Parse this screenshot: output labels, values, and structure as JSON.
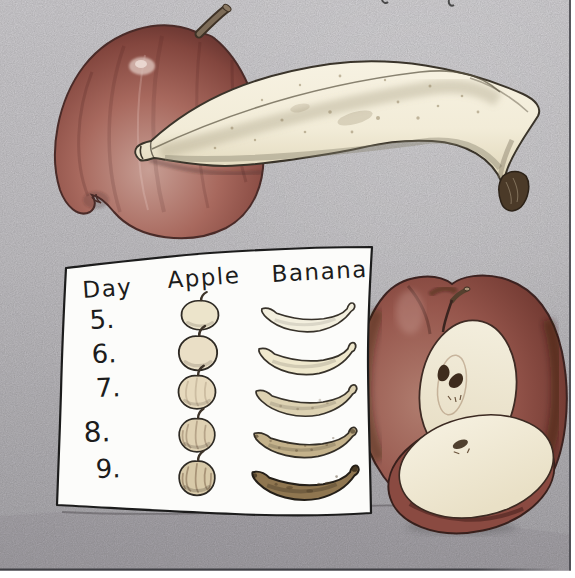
{
  "illustration": {
    "top_scene_alt": "Whole apple with a banana lying in front of it",
    "right_scene_alt": "Apple cut in half with a cut slice in front",
    "chart_alt": "Hand-drawn fruit ripening observation chart on white paper"
  },
  "chart_note": {
    "headers": [
      "Day",
      "Apple",
      "Banana"
    ],
    "rows": [
      {
        "day": "5.",
        "apple_color": "#ece4cb",
        "banana_color": "#f3efde"
      },
      {
        "day": "6.",
        "apple_color": "#eadfc6",
        "banana_color": "#efe8cd"
      },
      {
        "day": "7.",
        "apple_color": "#e6d9bd",
        "banana_color": "#ddd2b2"
      },
      {
        "day": "8.",
        "apple_color": "#dfd1b3",
        "banana_color": "#c4b28b"
      },
      {
        "day": "9.",
        "apple_color": "#d8caa9",
        "banana_color": "#8f7650"
      }
    ]
  },
  "colors": {
    "background_top": "#dcdade",
    "background_bottom": "#b3b1b6",
    "paper": "#fcfcfa",
    "ink": "#1c1c1c",
    "apple_skin": "#96564c",
    "apple_skin_dark": "#5e2f2b",
    "banana_body": "#f2ecd8",
    "banana_tip": "#4b3a28",
    "apple_flesh": "#f3eedd",
    "seed": "#3e2c1d",
    "margin_white": "#ffffff",
    "border_line": "#45454a"
  }
}
